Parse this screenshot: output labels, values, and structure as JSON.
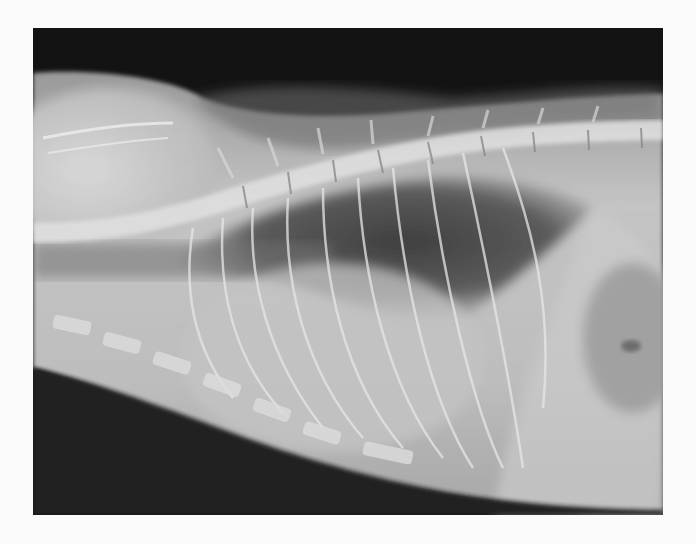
{
  "image": {
    "kind": "radiograph",
    "subject": "lateral thoracic radiograph",
    "alt": "Lateral X-ray of an animal thorax showing spine, ribs, heart silhouette, and lung fields",
    "colors": {
      "page_background": "#fbfbfb",
      "air_dark": "#0d0d0d",
      "soft_tissue": "#b9b9b9",
      "bone": "#eeeeee",
      "lung": "#555555"
    }
  }
}
